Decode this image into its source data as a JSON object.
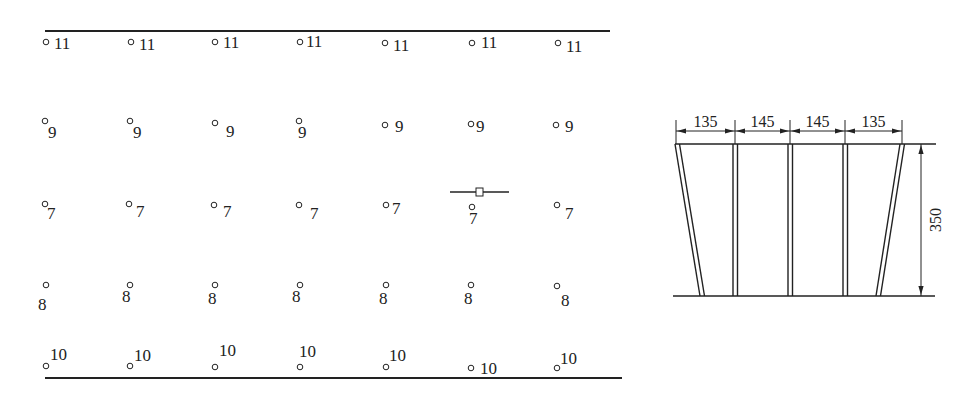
{
  "grid": {
    "top_line": {
      "x1": 45,
      "x2": 610,
      "y": 31
    },
    "bottom_line": {
      "x1": 45,
      "x2": 622,
      "y": 378
    },
    "rows": [
      {
        "label": "11",
        "points": [
          {
            "cx": 46,
            "cy": 42,
            "tx": 54,
            "ty": 49
          },
          {
            "cx": 131,
            "cy": 42,
            "tx": 139,
            "ty": 50
          },
          {
            "cx": 215,
            "cy": 42,
            "tx": 223,
            "ty": 48
          },
          {
            "cx": 300,
            "cy": 42,
            "tx": 306,
            "ty": 47
          },
          {
            "cx": 385,
            "cy": 43,
            "tx": 393,
            "ty": 51
          },
          {
            "cx": 472,
            "cy": 43,
            "tx": 481,
            "ty": 48
          },
          {
            "cx": 558,
            "cy": 43,
            "tx": 566,
            "ty": 52
          }
        ]
      },
      {
        "label": "9",
        "points": [
          {
            "cx": 45,
            "cy": 121,
            "tx": 48,
            "ty": 138
          },
          {
            "cx": 130,
            "cy": 121,
            "tx": 133,
            "ty": 138
          },
          {
            "cx": 215,
            "cy": 123,
            "tx": 226,
            "ty": 137
          },
          {
            "cx": 299,
            "cy": 121,
            "tx": 298,
            "ty": 138
          },
          {
            "cx": 385,
            "cy": 125,
            "tx": 395,
            "ty": 132
          },
          {
            "cx": 471,
            "cy": 124,
            "tx": 476,
            "ty": 132
          },
          {
            "cx": 556,
            "cy": 125,
            "tx": 565,
            "ty": 132
          }
        ]
      },
      {
        "label": "7",
        "points": [
          {
            "cx": 45,
            "cy": 204,
            "tx": 47,
            "ty": 219
          },
          {
            "cx": 129,
            "cy": 204,
            "tx": 136,
            "ty": 217
          },
          {
            "cx": 214,
            "cy": 205,
            "tx": 223,
            "ty": 217
          },
          {
            "cx": 299,
            "cy": 205,
            "tx": 310,
            "ty": 219
          },
          {
            "cx": 386,
            "cy": 205,
            "tx": 392,
            "ty": 214
          },
          {
            "cx": 472,
            "cy": 207,
            "tx": 469,
            "ty": 224
          },
          {
            "cx": 557,
            "cy": 205,
            "tx": 565,
            "ty": 219
          }
        ]
      },
      {
        "label": "8",
        "points": [
          {
            "cx": 46,
            "cy": 285,
            "tx": 38,
            "ty": 310
          },
          {
            "cx": 130,
            "cy": 285,
            "tx": 122,
            "ty": 302
          },
          {
            "cx": 215,
            "cy": 285,
            "tx": 208,
            "ty": 304
          },
          {
            "cx": 300,
            "cy": 285,
            "tx": 292,
            "ty": 302
          },
          {
            "cx": 386,
            "cy": 285,
            "tx": 379,
            "ty": 304
          },
          {
            "cx": 471,
            "cy": 285,
            "tx": 464,
            "ty": 304
          },
          {
            "cx": 557,
            "cy": 286,
            "tx": 561,
            "ty": 306
          }
        ]
      },
      {
        "label": "10",
        "points": [
          {
            "cx": 46,
            "cy": 366,
            "tx": 50,
            "ty": 360
          },
          {
            "cx": 130,
            "cy": 366,
            "tx": 134,
            "ty": 361
          },
          {
            "cx": 215,
            "cy": 367,
            "tx": 219,
            "ty": 356
          },
          {
            "cx": 300,
            "cy": 367,
            "tx": 299,
            "ty": 357
          },
          {
            "cx": 386,
            "cy": 367,
            "tx": 389,
            "ty": 361
          },
          {
            "cx": 471,
            "cy": 368,
            "tx": 480,
            "ty": 374
          },
          {
            "cx": 557,
            "cy": 368,
            "tx": 560,
            "ty": 364
          }
        ]
      }
    ],
    "marker": {
      "x1": 450,
      "x2": 509,
      "y": 192,
      "box_x": 476,
      "box_y": 188,
      "box_w": 7,
      "box_h": 8
    }
  },
  "section": {
    "top_y": 144,
    "bottom_y": 296,
    "top_line": {
      "x1": 675,
      "x2": 936
    },
    "bottom_line": {
      "x1": 673,
      "x2": 935
    },
    "dim_y": 131,
    "dim_ext_top": 120,
    "dim_ticks_x": [
      676,
      735,
      790,
      845,
      902
    ],
    "widths": [
      "135",
      "145",
      "145",
      "135"
    ],
    "height_dim": {
      "x": 921,
      "label": "350",
      "label_x": 937,
      "label_y": 220
    },
    "posts": [
      {
        "top_x": 677,
        "bottom_x": 702
      },
      {
        "top_x": 735,
        "bottom_x": 735
      },
      {
        "top_x": 790,
        "bottom_x": 790
      },
      {
        "top_x": 845,
        "bottom_x": 845
      },
      {
        "top_x": 902,
        "bottom_x": 878
      }
    ]
  },
  "colors": {
    "ink": "#222222",
    "background": "#ffffff"
  }
}
